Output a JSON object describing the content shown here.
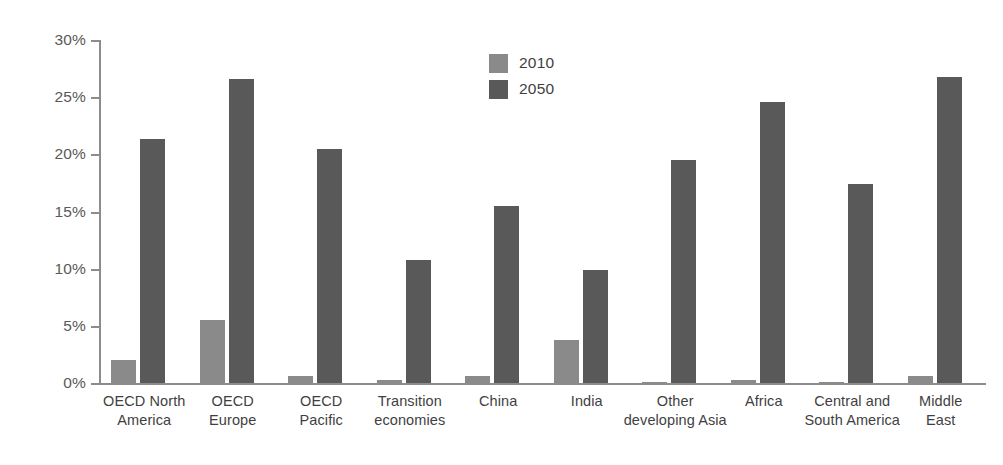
{
  "chart_data": {
    "type": "bar",
    "title": "",
    "subtitle": "",
    "xlabel": "",
    "ylabel": "",
    "ylim": [
      0,
      30
    ],
    "y_unit": "%",
    "grid": false,
    "legend_position": "top-center",
    "categories": [
      "OECD North\nAmerica",
      "OECD\nEurope",
      "OECD\nPacific",
      "Transition\neconomies",
      "China",
      "India",
      "Other\ndeveloping Asia",
      "Africa",
      "Central and\nSouth America",
      "Middle\nEast"
    ],
    "series": [
      {
        "name": "2010",
        "color": "#8a8a8a",
        "values": [
          2.0,
          5.5,
          0.6,
          0.3,
          0.6,
          3.8,
          0.1,
          0.3,
          0.05,
          0.6
        ]
      },
      {
        "name": "2050",
        "color": "#595959",
        "values": [
          21.3,
          26.6,
          20.5,
          10.8,
          15.5,
          9.9,
          19.5,
          24.6,
          17.4,
          26.8
        ]
      }
    ],
    "y_ticks": [
      {
        "value": 30,
        "label": "30%"
      },
      {
        "value": 25,
        "label": "25%"
      },
      {
        "value": 20,
        "label": "20%"
      },
      {
        "value": 15,
        "label": "15%"
      },
      {
        "value": 10,
        "label": "10%"
      },
      {
        "value": 5,
        "label": "5%"
      },
      {
        "value": 0,
        "label": "0%"
      }
    ]
  },
  "legend": {
    "entries": [
      {
        "label": "2010",
        "color": "#8a8a8a"
      },
      {
        "label": "2050",
        "color": "#595959"
      }
    ]
  },
  "colors": {
    "axis": "#8c8c8c",
    "text": "#3f3f3f",
    "background": "#ffffff",
    "series_2010": "#8a8a8a",
    "series_2050": "#595959"
  }
}
